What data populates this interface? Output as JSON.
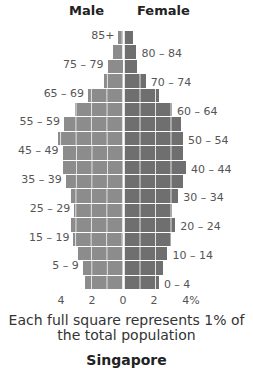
{
  "header": {
    "male_label": "Male",
    "female_label": "Female"
  },
  "caption": {
    "line1": "Each full square represents 1% of",
    "line2": "the total population"
  },
  "title": "Singapore",
  "colors": {
    "male": "#8c8c8c",
    "female": "#6f6f6f",
    "grid": "#e6e6e6"
  },
  "axis": {
    "ticks": [
      "4",
      "2",
      "0",
      "2",
      "4%"
    ]
  },
  "chart_data": {
    "type": "bar",
    "orientation": "horizontal-population-pyramid",
    "title": "Singapore",
    "subtitle": "Each full square represents 1% of the total population",
    "xlabel": "% of total population",
    "ylabel": "Age group",
    "xlim": [
      -4,
      4
    ],
    "xticks": [
      "4",
      "2",
      "0",
      "2",
      "4%"
    ],
    "grid": true,
    "legend": [
      "Male",
      "Female"
    ],
    "legend_position": "top",
    "categories": [
      "85+",
      "80 – 84",
      "75 – 79",
      "70 – 74",
      "65 – 69",
      "60 – 64",
      "55 – 59",
      "50 – 54",
      "45 – 49",
      "40 – 44",
      "35 – 39",
      "30 – 34",
      "25 – 29",
      "20 – 24",
      "15 – 19",
      "10 – 14",
      "5 – 9",
      "0 – 4"
    ],
    "series": [
      {
        "name": "Male",
        "values": [
          0.3,
          0.65,
          1.0,
          1.25,
          2.25,
          3.1,
          3.8,
          4.2,
          3.9,
          3.9,
          3.7,
          3.35,
          3.15,
          3.35,
          3.2,
          2.9,
          2.6,
          2.45
        ]
      },
      {
        "name": "Female",
        "values": [
          0.6,
          0.8,
          0.85,
          1.4,
          2.25,
          3.1,
          3.7,
          3.8,
          3.8,
          4.0,
          3.8,
          3.5,
          3.1,
          3.3,
          3.0,
          2.8,
          2.5,
          2.25
        ]
      }
    ],
    "label_side": [
      "left",
      "right",
      "left",
      "right",
      "left",
      "right",
      "left",
      "right",
      "left",
      "right",
      "left",
      "right",
      "left",
      "right",
      "left",
      "right",
      "left",
      "right"
    ]
  }
}
